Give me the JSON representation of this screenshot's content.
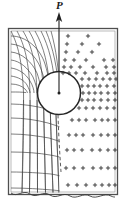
{
  "figure": {
    "type": "engineering-stress-diagram",
    "load_label": "P",
    "colors": {
      "line": "#303030",
      "frame": "#4a4a4a",
      "marker": "#2b2b2b",
      "background": "#ffffff"
    },
    "frame": {
      "x": 8,
      "y": 28,
      "width": 110,
      "height": 166
    },
    "hole": {
      "cx": 59,
      "cy": 93,
      "r": 21.5
    },
    "load_arrow": {
      "x": 59,
      "y_top": 14,
      "y_bottom": 93
    },
    "break_line_y": 196
  },
  "chart_data": {
    "type": "scatter",
    "title": "",
    "xlabel": "",
    "ylabel": "",
    "legend": [],
    "grid": false,
    "marker_symbol": "+",
    "marker_rows": [
      {
        "y": 36,
        "xs": [
          68,
          88
        ]
      },
      {
        "y": 44,
        "xs": [
          67,
          82,
          99
        ]
      },
      {
        "y": 52,
        "xs": [
          66,
          78,
          92
        ]
      },
      {
        "y": 60,
        "xs": [
          65,
          74,
          86,
          104,
          113
        ]
      },
      {
        "y": 67,
        "xs": [
          64,
          71,
          80,
          93,
          106,
          114
        ]
      },
      {
        "y": 73,
        "xs": [
          63,
          69,
          76,
          85,
          97,
          107,
          114
        ]
      },
      {
        "y": 79,
        "xs": [
          82,
          89,
          96,
          103,
          110,
          116
        ]
      },
      {
        "y": 86,
        "xs": [
          82,
          88,
          94,
          100,
          107,
          114
        ]
      },
      {
        "y": 93,
        "xs": [
          83,
          89,
          95,
          101,
          108,
          115
        ]
      },
      {
        "y": 100,
        "xs": [
          82,
          88,
          94,
          101,
          108,
          115
        ]
      },
      {
        "y": 108,
        "xs": [
          79,
          86,
          93,
          100,
          107,
          114
        ]
      },
      {
        "y": 120,
        "xs": [
          72,
          79,
          86,
          95,
          102,
          108,
          115
        ]
      },
      {
        "y": 135,
        "xs": [
          69,
          76,
          83,
          93,
          101,
          108,
          115
        ]
      },
      {
        "y": 150,
        "xs": [
          67,
          74,
          82,
          92,
          100,
          108,
          115
        ]
      },
      {
        "y": 168,
        "xs": [
          66,
          74,
          83,
          93,
          101,
          108,
          115
        ]
      },
      {
        "y": 185,
        "xs": [
          68,
          77,
          86,
          95,
          102,
          109,
          115
        ]
      }
    ],
    "mesh_radial_count": 9,
    "mesh_circumferential_count": 8
  }
}
